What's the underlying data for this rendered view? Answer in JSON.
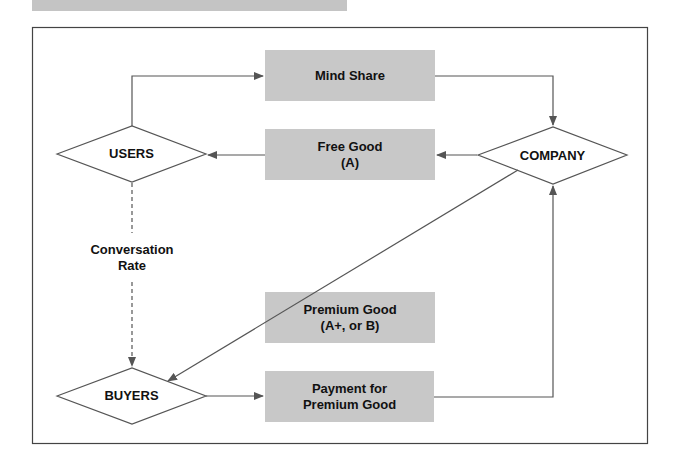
{
  "diagram": {
    "boxes": {
      "mind_share": "Mind Share",
      "free_good": "Free Good\n(A)",
      "premium_good": "Premium Good\n(A+, or B)",
      "payment": "Payment for\nPremium Good"
    },
    "nodes": {
      "users": "USERS",
      "company": "COMPANY",
      "buyers": "BUYERS"
    },
    "edge_labels": {
      "conversion": "Conversation\nRate"
    },
    "colors": {
      "box_fill": "#c8c8c8",
      "line": "#555555",
      "frame": "#444444"
    }
  }
}
